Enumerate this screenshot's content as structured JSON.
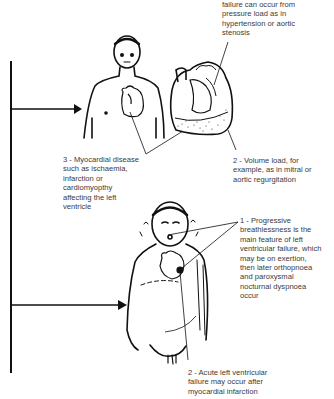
{
  "figure": {
    "stages": [
      {
        "id": "compensated",
        "causes": [
          {
            "num": "1",
            "text": "failure can occur from\npressure load as in\nhypertension or aortic\nstenosis"
          },
          {
            "num": "2",
            "text": "2 - Volume load, for\nexample, as in mitral or\naortic regurgitation"
          },
          {
            "num": "3",
            "text": "3 - Myocardial disease\nsuch as ischaemia,\ninfarction or\ncardiomyopthy\naffecting the left\nventricle"
          }
        ]
      },
      {
        "id": "failure",
        "features": [
          {
            "num": "1",
            "text": "1 - Progressive\nbreathlessness is the\nmain feature of left\nventricular failure, which\nmay be on exertion,\nthen later orthopnoea\nand paroxysmal\nnocturnal dyspnoea\noccur"
          },
          {
            "num": "2",
            "text": "2 - Acute left ventricular\nfailure may occur after\nmyocardial infarction"
          }
        ]
      }
    ],
    "colors": {
      "line": "#111111",
      "text": "#3a3a3a",
      "background": "#ffffff"
    }
  }
}
